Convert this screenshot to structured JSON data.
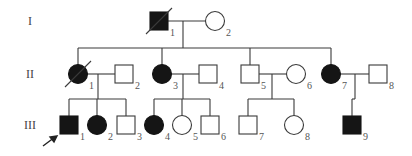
{
  "diagram": {
    "type": "pedigree",
    "generations": [
      {
        "label": "I",
        "y": 21
      },
      {
        "label": "II",
        "y": 74
      },
      {
        "label": "III",
        "y": 125
      }
    ],
    "individuals": [
      {
        "id": "I-1",
        "gen": "I",
        "num": "1",
        "sex": "male",
        "affected": true,
        "deceased": true,
        "cx": 159,
        "cy": 21
      },
      {
        "id": "I-2",
        "gen": "I",
        "num": "2",
        "sex": "female",
        "affected": false,
        "deceased": false,
        "cx": 215,
        "cy": 21
      },
      {
        "id": "II-1",
        "gen": "II",
        "num": "1",
        "sex": "female",
        "affected": true,
        "deceased": true,
        "cx": 78,
        "cy": 74
      },
      {
        "id": "II-2",
        "gen": "II",
        "num": "2",
        "sex": "male",
        "affected": false,
        "deceased": false,
        "cx": 124,
        "cy": 74
      },
      {
        "id": "II-3",
        "gen": "II",
        "num": "3",
        "sex": "female",
        "affected": true,
        "deceased": false,
        "cx": 162,
        "cy": 74
      },
      {
        "id": "II-4",
        "gen": "II",
        "num": "4",
        "sex": "male",
        "affected": false,
        "deceased": false,
        "cx": 208,
        "cy": 74
      },
      {
        "id": "II-5",
        "gen": "II",
        "num": "5",
        "sex": "male",
        "affected": false,
        "deceased": false,
        "cx": 250,
        "cy": 74
      },
      {
        "id": "II-6",
        "gen": "II",
        "num": "6",
        "sex": "female",
        "affected": false,
        "deceased": false,
        "cx": 296,
        "cy": 74
      },
      {
        "id": "II-7",
        "gen": "II",
        "num": "7",
        "sex": "female",
        "affected": true,
        "deceased": false,
        "cx": 331,
        "cy": 74
      },
      {
        "id": "II-8",
        "gen": "II",
        "num": "8",
        "sex": "male",
        "affected": false,
        "deceased": false,
        "cx": 378,
        "cy": 74
      },
      {
        "id": "III-1",
        "gen": "III",
        "num": "1",
        "sex": "male",
        "affected": true,
        "deceased": false,
        "proband": true,
        "cx": 69,
        "cy": 125
      },
      {
        "id": "III-2",
        "gen": "III",
        "num": "2",
        "sex": "female",
        "affected": true,
        "deceased": false,
        "cx": 97,
        "cy": 125
      },
      {
        "id": "III-3",
        "gen": "III",
        "num": "3",
        "sex": "male",
        "affected": false,
        "deceased": false,
        "cx": 126,
        "cy": 125
      },
      {
        "id": "III-4",
        "gen": "III",
        "num": "4",
        "sex": "female",
        "affected": true,
        "deceased": false,
        "cx": 154,
        "cy": 125
      },
      {
        "id": "III-5",
        "gen": "III",
        "num": "5",
        "sex": "female",
        "affected": false,
        "deceased": false,
        "cx": 182,
        "cy": 125
      },
      {
        "id": "III-6",
        "gen": "III",
        "num": "6",
        "sex": "male",
        "affected": false,
        "deceased": false,
        "cx": 210,
        "cy": 125
      },
      {
        "id": "III-7",
        "gen": "III",
        "num": "7",
        "sex": "male",
        "affected": false,
        "deceased": false,
        "cx": 248,
        "cy": 125
      },
      {
        "id": "III-8",
        "gen": "III",
        "num": "8",
        "sex": "female",
        "affected": false,
        "deceased": false,
        "cx": 294,
        "cy": 125
      },
      {
        "id": "III-9",
        "gen": "III",
        "num": "9",
        "sex": "male",
        "affected": true,
        "deceased": false,
        "cx": 352,
        "cy": 125
      }
    ],
    "matings": [
      {
        "a": "I-1",
        "b": "I-2",
        "y": 21,
        "drop_x": 183
      },
      {
        "a": "II-1",
        "b": "II-2",
        "y": 74,
        "drop_x": 98
      },
      {
        "a": "II-3",
        "b": "II-4",
        "y": 74,
        "drop_x": 183
      },
      {
        "a": "II-5",
        "b": "II-6",
        "y": 74,
        "drop_x": 272
      },
      {
        "a": "II-7",
        "b": "II-8",
        "y": 74,
        "drop_x": 355
      }
    ],
    "sibships": [
      {
        "parents": "I-1 x I-2",
        "drop_x": 183,
        "y": 48,
        "children": [
          "II-1",
          "II-3",
          "II-5",
          "II-7"
        ]
      },
      {
        "parents": "II-1 x II-2",
        "drop_x": 98,
        "y": 99,
        "children": [
          "III-1",
          "III-2",
          "III-3"
        ]
      },
      {
        "parents": "II-3 x II-4",
        "drop_x": 183,
        "y": 99,
        "children": [
          "III-4",
          "III-5",
          "III-6"
        ]
      },
      {
        "parents": "II-5 x II-6",
        "drop_x": 272,
        "y": 99,
        "children": [
          "III-7",
          "III-8"
        ]
      },
      {
        "parents": "II-7 x II-8",
        "drop_x": 355,
        "y": 99,
        "children": [
          "III-9"
        ]
      }
    ],
    "proband_arrow": {
      "target": "III-1"
    },
    "colors": {
      "affected": "#151515",
      "unaffected": "#ffffff",
      "line": "#3a3a3a"
    }
  }
}
